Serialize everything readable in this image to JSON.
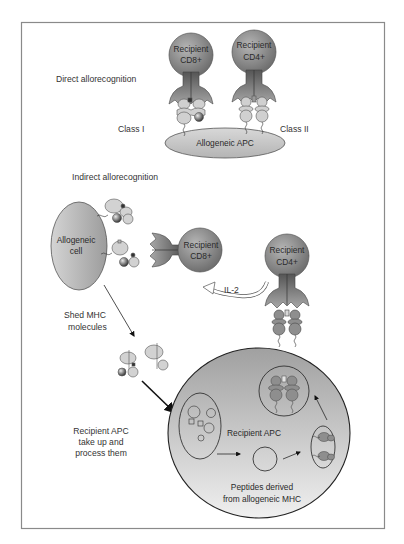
{
  "figure": {
    "colors": {
      "frame": "#8a8a8a",
      "tcell_dark": "#6e6e6e",
      "tcell_light": "#b8b8b8",
      "mhc_fill": "#d2d2d2",
      "apc_fill": "#c8c8c8",
      "outline": "#444444"
    }
  },
  "direct": {
    "heading": "Direct allorecognition",
    "cd8_cell": {
      "line1": "Recipient",
      "line2": "CD8+"
    },
    "cd4_cell": {
      "line1": "Recipient",
      "line2": "CD4+"
    },
    "class1_label": "Class I",
    "class2_label": "Class II",
    "apc_label": "Allogeneic APC"
  },
  "indirect": {
    "heading": "Indirect allorecognition",
    "allogeneic_cell": {
      "line1": "Allogeneic",
      "line2": "cell"
    },
    "cd8_cell": {
      "line1": "Recipient",
      "line2": "CD8+"
    },
    "cd4_cell": {
      "line1": "Recipient",
      "line2": "CD4+"
    },
    "il2_label": "IL-2",
    "shed_label": {
      "line1": "Shed MHC",
      "line2": "molecules"
    },
    "uptake_label": {
      "line1": "Recipient APC",
      "line2": "take up and",
      "line3": "process them"
    },
    "recipient_apc_label": "Recipient APC",
    "peptides_label": {
      "line1": "Peptides derived",
      "line2": "from allogeneic MHC"
    }
  }
}
